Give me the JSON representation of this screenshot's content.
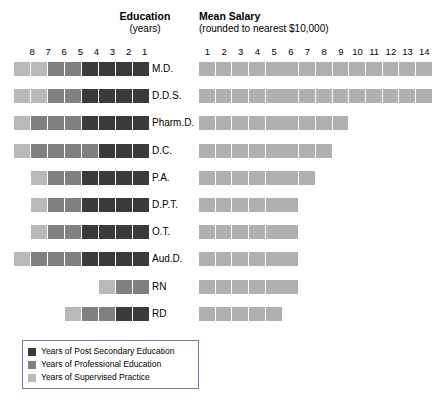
{
  "education_panel": {
    "title": "Education",
    "subtitle": "(years)",
    "axis_ticks": [
      "8",
      "7",
      "6",
      "5",
      "4",
      "3",
      "2",
      "1"
    ]
  },
  "salary_panel": {
    "title": "Mean Salary",
    "subtitle": "(rounded to nearest $10,000)",
    "axis_ticks": [
      "1",
      "2",
      "3",
      "4",
      "5",
      "6",
      "7",
      "8",
      "9",
      "10",
      "11",
      "12",
      "13",
      "14"
    ]
  },
  "legend": {
    "items": [
      {
        "label": "Years of Post Secondary Education",
        "swatch": "dark"
      },
      {
        "label": "Years of Professional Education",
        "swatch": "med"
      },
      {
        "label": "Years of Supervised Practice",
        "swatch": "light"
      }
    ]
  },
  "colors": {
    "post_secondary": "#3a3a3a",
    "professional": "#808080",
    "supervised_practice": "#b9b9b9",
    "salary": "#b0b0b0",
    "legend_border": "#6a7ea8"
  },
  "chart_data": {
    "type": "bar",
    "orientation": "horizontal",
    "categories": [
      "M.D.",
      "D.D.S.",
      "Pharm.D.",
      "D.C.",
      "P.A.",
      "D.P.T.",
      "O.T.",
      "Aud.D.",
      "RN",
      "RD"
    ],
    "panels": [
      {
        "name": "Education",
        "xlabel": "years",
        "xlim": [
          0,
          8
        ],
        "axis_direction": "reversed",
        "tick_labels": [
          "8",
          "7",
          "6",
          "5",
          "4",
          "3",
          "2",
          "1"
        ],
        "grid": false,
        "stacked": true,
        "series": [
          {
            "name": "Years of Post Secondary Education",
            "color": "#3a3a3a",
            "values": [
              4,
              4,
              4,
              3,
              4,
              4,
              4,
              4,
              0,
              2
            ]
          },
          {
            "name": "Years of Professional Education",
            "color": "#808080",
            "values": [
              2,
              2,
              3,
              4,
              2,
              2,
              2,
              3,
              2,
              2
            ]
          },
          {
            "name": "Years of Supervised Practice",
            "color": "#b9b9b9",
            "values": [
              2,
              2,
              1,
              1,
              1,
              1,
              1,
              1,
              1,
              1
            ]
          }
        ],
        "totals": [
          8,
          8,
          8,
          8,
          7,
          7,
          7,
          8,
          3,
          5
        ]
      },
      {
        "name": "Mean Salary",
        "xlabel": "rounded to nearest $10,000",
        "xlim": [
          0,
          14
        ],
        "tick_labels": [
          "1",
          "2",
          "3",
          "4",
          "5",
          "6",
          "7",
          "8",
          "9",
          "10",
          "11",
          "12",
          "13",
          "14"
        ],
        "grid": false,
        "unit": "$10,000",
        "values": [
          14,
          14,
          9,
          8,
          7,
          6,
          6,
          6,
          6,
          5
        ],
        "color": "#b0b0b0"
      }
    ]
  },
  "rows": [
    {
      "label": "M.D.",
      "edu": [
        "light",
        "light",
        "med",
        "med",
        "dark",
        "dark",
        "dark",
        "dark"
      ],
      "salary": 14
    },
    {
      "label": "D.D.S.",
      "edu": [
        "light",
        "light",
        "med",
        "med",
        "dark",
        "dark",
        "dark",
        "dark"
      ],
      "salary": 14
    },
    {
      "label": "Pharm.D.",
      "edu": [
        "light",
        "med",
        "med",
        "med",
        "dark",
        "dark",
        "dark",
        "dark"
      ],
      "salary": 9
    },
    {
      "label": "D.C.",
      "edu": [
        "light",
        "med",
        "med",
        "med",
        "med",
        "dark",
        "dark",
        "dark"
      ],
      "salary": 8
    },
    {
      "label": "P.A.",
      "edu": [
        "light",
        "med",
        "med",
        "dark",
        "dark",
        "dark",
        "dark"
      ],
      "salary": 7
    },
    {
      "label": "D.P.T.",
      "edu": [
        "light",
        "med",
        "med",
        "dark",
        "dark",
        "dark",
        "dark"
      ],
      "salary": 6
    },
    {
      "label": "O.T.",
      "edu": [
        "light",
        "med",
        "med",
        "dark",
        "dark",
        "dark",
        "dark"
      ],
      "salary": 6
    },
    {
      "label": "Aud.D.",
      "edu": [
        "light",
        "med",
        "med",
        "med",
        "dark",
        "dark",
        "dark",
        "dark"
      ],
      "salary": 6
    },
    {
      "label": "RN",
      "edu": [
        "light",
        "med",
        "med"
      ],
      "salary": 6
    },
    {
      "label": "RD",
      "edu": [
        "light",
        "med",
        "med",
        "dark",
        "dark"
      ],
      "salary": 5
    }
  ]
}
